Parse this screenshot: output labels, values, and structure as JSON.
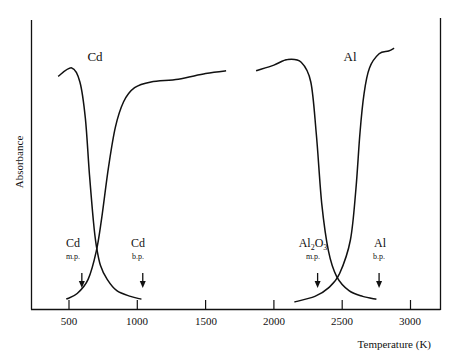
{
  "chart_data": {
    "type": "line",
    "title": "",
    "xlabel": "Temperature (K)",
    "ylabel": "Absorbance",
    "xlim": [
      300,
      3200
    ],
    "ylim": [
      0,
      1
    ],
    "grid": false,
    "legend": null,
    "xticks": [
      500,
      1000,
      1500,
      2000,
      2500,
      3000
    ],
    "xtick_labels": [
      "500",
      "1000",
      "1500",
      "2000",
      "2500",
      "3000"
    ],
    "panels": [
      {
        "title": "Cd",
        "title_x": 570
      },
      {
        "title": "Al",
        "title_x": 2430
      }
    ],
    "series": [
      {
        "name": "Cd (decreasing)",
        "x": [
          420,
          520,
          580,
          620,
          650,
          680,
          700,
          730,
          780,
          850,
          950,
          1030
        ],
        "y": [
          0.8,
          0.83,
          0.78,
          0.65,
          0.45,
          0.28,
          0.2,
          0.13,
          0.08,
          0.04,
          0.02,
          0.01
        ]
      },
      {
        "name": "Cd (increasing)",
        "x": [
          480,
          560,
          640,
          700,
          740,
          790,
          840,
          900,
          980,
          1100,
          1300,
          1500,
          1650
        ],
        "y": [
          0.01,
          0.03,
          0.08,
          0.18,
          0.3,
          0.48,
          0.62,
          0.71,
          0.76,
          0.78,
          0.79,
          0.81,
          0.82
        ]
      },
      {
        "name": "Al (decreasing)",
        "x": [
          1870,
          2000,
          2100,
          2200,
          2270,
          2310,
          2350,
          2400,
          2460,
          2550,
          2650,
          2750
        ],
        "y": [
          0.82,
          0.84,
          0.86,
          0.85,
          0.78,
          0.6,
          0.35,
          0.18,
          0.09,
          0.04,
          0.02,
          0.01
        ]
      },
      {
        "name": "Al (increasing)",
        "x": [
          2150,
          2300,
          2400,
          2480,
          2560,
          2600,
          2630,
          2660,
          2700,
          2770,
          2840,
          2880
        ],
        "y": [
          0.0,
          0.02,
          0.05,
          0.1,
          0.22,
          0.4,
          0.6,
          0.74,
          0.83,
          0.88,
          0.89,
          0.9
        ]
      }
    ],
    "annotations": [
      {
        "label": "Cd",
        "sub": "m.p.",
        "x": 594,
        "arrow": true
      },
      {
        "label": "Cd",
        "sub": "b.p.",
        "x": 1040,
        "arrow": true
      },
      {
        "label": "Al2O3",
        "sub": "m.p.",
        "x": 2320,
        "arrow": true
      },
      {
        "label": "Al",
        "sub": "b.p.",
        "x": 2770,
        "arrow": true
      }
    ]
  },
  "labels": {
    "panel_cd": "Cd",
    "panel_al": "Al",
    "ylabel": "Absorbance",
    "xlabel": "Temperature (K)",
    "ticks": [
      "500",
      "1000",
      "1500",
      "2000",
      "2500",
      "3000"
    ],
    "ann_cd_mp_main": "Cd",
    "ann_cd_mp_sub": "m.p.",
    "ann_cd_bp_main": "Cd",
    "ann_cd_bp_sub": "b.p.",
    "ann_al2o3_main_a": "Al",
    "ann_al2o3_main_b": "2",
    "ann_al2o3_main_c": "O",
    "ann_al2o3_main_d": "3",
    "ann_al2o3_sub": "m.p.",
    "ann_al_bp_main": "Al",
    "ann_al_bp_sub": "b.p."
  },
  "colors": {
    "line": "#111111",
    "background": "#ffffff"
  }
}
